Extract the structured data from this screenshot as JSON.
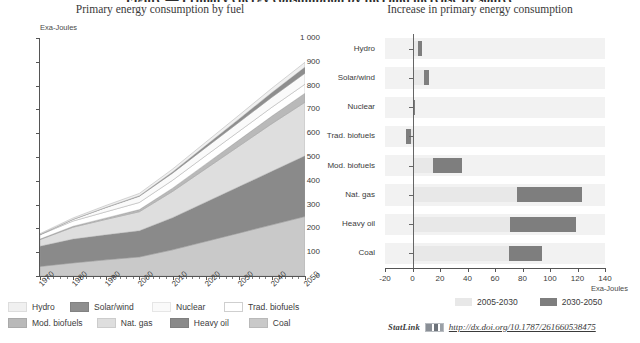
{
  "clipped_heading": "Figure — Primary energy consumption by fuel and increase by source",
  "panels": {
    "left": {
      "title": "Primary energy consumption by fuel"
    },
    "right": {
      "title": "Increase in primary energy consumption"
    }
  },
  "statlink": {
    "label": "StatLink",
    "icon": "statlink-barcode-icon",
    "url": "http://dx.doi.org/10.1787/261660538475"
  },
  "colors": {
    "hydro": "#f0f0f0",
    "solar_wind": "#8e8e8e",
    "nuclear": "#fafafa",
    "trad_biofuels": "#ffffff",
    "mod_biofuels": "#b9b9b9",
    "nat_gas": "#dedede",
    "heavy_oil": "#8a8a8a",
    "coal": "#c9c9c9",
    "period_2005_2030": "#e8e8e8",
    "period_2030_2050": "#7e7e7e",
    "band": "#f2f2f2",
    "axis": "#555555"
  },
  "chart_data": [
    {
      "type": "area",
      "id": "primary-energy-by-fuel",
      "title": "Primary energy consumption by fuel",
      "subtitle": "",
      "xlabel": "",
      "ylabel": "Exa-Joules",
      "ylim": [
        0,
        1000
      ],
      "ytick_step": 100,
      "yticks": [
        "0",
        "100",
        "200",
        "300",
        "400",
        "500",
        "600",
        "700",
        "800",
        "900",
        "1 000"
      ],
      "xlim": [
        1970,
        2050
      ],
      "xticks": [
        1970,
        1980,
        1990,
        2000,
        2010,
        2020,
        2030,
        2040,
        2050
      ],
      "xtick_labels": [
        "1970",
        "1980",
        "1990",
        "2000",
        "2010",
        "2020",
        "2030",
        "2040",
        "2050"
      ],
      "x": [
        1970,
        1980,
        1990,
        2000,
        2010,
        2020,
        2030,
        2040,
        2050
      ],
      "stacked": true,
      "grid": false,
      "legend_position": "below",
      "stack_order": [
        "Coal",
        "Heavy oil",
        "Nat. gas",
        "Mod. biofuels",
        "Trad. biofuels",
        "Nuclear",
        "Solar/wind",
        "Hydro"
      ],
      "series": [
        {
          "name": "Coal",
          "color": "#c9c9c9",
          "values": [
            40,
            55,
            68,
            80,
            110,
            145,
            180,
            215,
            250
          ]
        },
        {
          "name": "Heavy oil",
          "color": "#8a8a8a",
          "values": [
            85,
            100,
            105,
            110,
            135,
            165,
            195,
            225,
            255
          ]
        },
        {
          "name": "Nat. gas",
          "color": "#dedede",
          "values": [
            28,
            50,
            65,
            80,
            110,
            140,
            170,
            200,
            225
          ]
        },
        {
          "name": "Mod. biofuels",
          "color": "#b9b9b9",
          "values": [
            2,
            4,
            6,
            9,
            14,
            20,
            26,
            32,
            38
          ]
        },
        {
          "name": "Trad. biofuels",
          "color": "#ffffff",
          "values": [
            18,
            22,
            26,
            30,
            33,
            35,
            36,
            37,
            38
          ]
        },
        {
          "name": "Nuclear",
          "color": "#fafafa",
          "values": [
            1,
            7,
            18,
            26,
            30,
            34,
            38,
            42,
            46
          ]
        },
        {
          "name": "Solar/wind",
          "color": "#8e8e8e",
          "values": [
            0,
            0,
            1,
            2,
            5,
            9,
            14,
            20,
            26
          ]
        },
        {
          "name": "Hydro",
          "color": "#f0f0f0",
          "values": [
            4,
            6,
            8,
            10,
            12,
            14,
            16,
            18,
            20
          ]
        }
      ],
      "legend": [
        {
          "label": "Hydro",
          "color": "#f0f0f0"
        },
        {
          "label": "Solar/wind",
          "color": "#8e8e8e"
        },
        {
          "label": "Nuclear",
          "color": "#fafafa"
        },
        {
          "label": "Trad. biofuels",
          "color": "#ffffff"
        },
        {
          "label": "Mod. biofuels",
          "color": "#b9b9b9"
        },
        {
          "label": "Nat. gas",
          "color": "#dedede"
        },
        {
          "label": "Heavy oil",
          "color": "#8a8a8a"
        },
        {
          "label": "Coal",
          "color": "#c9c9c9"
        }
      ]
    },
    {
      "type": "bar",
      "id": "increase-in-primary-energy",
      "orientation": "horizontal",
      "stacked": true,
      "title": "Increase in primary energy consumption",
      "xlabel": "Exa-Joules",
      "ylabel": "",
      "xlim": [
        -20,
        140
      ],
      "xtick_step": 20,
      "xticks": [
        -20,
        0,
        20,
        40,
        60,
        80,
        100,
        120,
        140
      ],
      "xtick_labels": [
        "-20",
        "0",
        "20",
        "40",
        "60",
        "80",
        "100",
        "120",
        "140"
      ],
      "grid": false,
      "legend_position": "below",
      "categories": [
        "Hydro",
        "Solar/wind",
        "Nuclear",
        "Trad. biofuels",
        "Mod. biofuels",
        "Nat. gas",
        "Heavy oil",
        "Coal"
      ],
      "series": [
        {
          "name": "2005-2030",
          "color": "#e8e8e8",
          "values": [
            4,
            8,
            1,
            -5,
            15,
            76,
            71,
            70
          ]
        },
        {
          "name": "2030-2050",
          "color": "#7e7e7e",
          "values": [
            3,
            4,
            1,
            -4,
            21,
            47,
            48,
            24
          ]
        }
      ],
      "bars": [
        {
          "category": "Hydro",
          "start_2005_2030": 0,
          "end_2005_2030": 4,
          "start_2030_2050": 4,
          "end_2030_2050": 7
        },
        {
          "category": "Solar/wind",
          "start_2005_2030": 0,
          "end_2005_2030": 8,
          "start_2030_2050": 8,
          "end_2030_2050": 12
        },
        {
          "category": "Nuclear",
          "start_2005_2030": 0,
          "end_2005_2030": 1,
          "start_2030_2050": 1,
          "end_2030_2050": 2
        },
        {
          "category": "Trad. biofuels",
          "start_2005_2030": -5,
          "end_2005_2030": 0,
          "start_2030_2050": -5,
          "end_2030_2050": -1
        },
        {
          "category": "Mod. biofuels",
          "start_2005_2030": 0,
          "end_2005_2030": 15,
          "start_2030_2050": 15,
          "end_2030_2050": 36
        },
        {
          "category": "Nat. gas",
          "start_2005_2030": 0,
          "end_2005_2030": 76,
          "start_2030_2050": 76,
          "end_2030_2050": 123
        },
        {
          "category": "Heavy oil",
          "start_2005_2030": 0,
          "end_2005_2030": 71,
          "start_2030_2050": 71,
          "end_2030_2050": 119
        },
        {
          "category": "Coal",
          "start_2005_2030": 0,
          "end_2005_2030": 70,
          "start_2030_2050": 70,
          "end_2030_2050": 94
        }
      ],
      "legend": [
        {
          "label": "2005-2030",
          "color": "#e8e8e8"
        },
        {
          "label": "2030-2050",
          "color": "#7e7e7e"
        }
      ]
    }
  ]
}
